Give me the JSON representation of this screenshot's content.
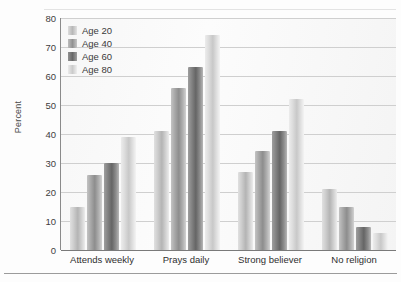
{
  "chart_data": {
    "type": "bar",
    "title": "",
    "subtitle": "",
    "xlabel": "",
    "ylabel": "Percent",
    "ylim": [
      0,
      80
    ],
    "yticks": [
      0,
      10,
      20,
      30,
      40,
      50,
      60,
      70,
      80
    ],
    "grid": true,
    "legend_position": "top-left",
    "categories": [
      "Attends weekly",
      "Prays daily",
      "Strong believer",
      "No religion"
    ],
    "series": [
      {
        "name": "Age 20",
        "values": [
          15,
          41,
          27,
          21
        ],
        "color": "#b4b4b4"
      },
      {
        "name": "Age 40",
        "values": [
          26,
          56,
          34,
          15
        ],
        "color": "#8d8d8d"
      },
      {
        "name": "Age 60",
        "values": [
          30,
          63,
          41,
          8
        ],
        "color": "#656565"
      },
      {
        "name": "Age 80",
        "values": [
          39,
          74,
          52,
          6
        ],
        "color": "#c8c8c8"
      }
    ]
  }
}
